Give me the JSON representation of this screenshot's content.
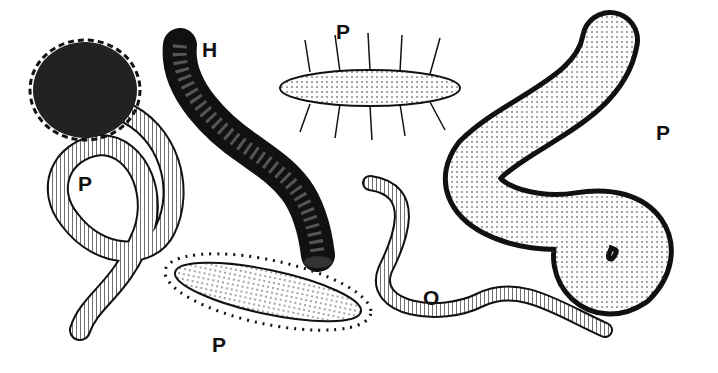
{
  "figure": {
    "background": "#ffffff",
    "ink": "#111111",
    "specimens": [
      {
        "label": "P",
        "x": 78,
        "y": 172,
        "desc": "polychaete with tentacle crown, looped body"
      },
      {
        "label": "H",
        "x": 202,
        "y": 38,
        "desc": "leech, dark banded"
      },
      {
        "label": "P",
        "x": 336,
        "y": 20,
        "desc": "polychaete with bristle tufts"
      },
      {
        "label": "P",
        "x": 656,
        "y": 121,
        "desc": "polychaete (ragworm) coiled with parapodia"
      },
      {
        "label": "O",
        "x": 423,
        "y": 286,
        "desc": "oligochaete (earthworm)"
      },
      {
        "label": "P",
        "x": 212,
        "y": 333,
        "desc": "spiny polychaete (scale worm)"
      }
    ]
  }
}
